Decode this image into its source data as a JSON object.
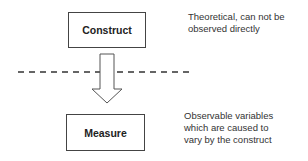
{
  "diagram": {
    "construct": {
      "label": "Construct",
      "note_lines": [
        "Theoretical, can not be",
        "observed directly"
      ]
    },
    "measure": {
      "label": "Measure",
      "note_lines": [
        "Observable variables",
        "which are caused to",
        "vary by the construct"
      ]
    },
    "connector": {
      "type": "hollow-down-arrow",
      "from": "Construct",
      "to": "Measure"
    },
    "divider": {
      "style": "dashed",
      "meaning": "boundary between unobservable and observable"
    }
  }
}
